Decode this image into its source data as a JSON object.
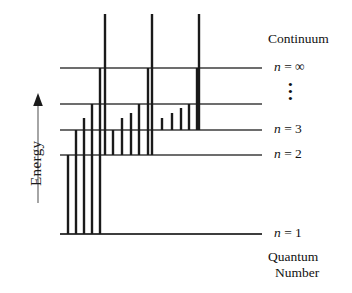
{
  "figure": {
    "title_top": "Continuum",
    "axis": {
      "label": "Energy",
      "direction": "up",
      "arrow_icon": "up-arrow-icon"
    },
    "bottom_caption_line1": "Quantum",
    "bottom_caption_line2": "Number",
    "ellipsis": "•\n•\n•",
    "colors": {
      "level_line": "#3d3d3d",
      "transition_line": "#1a1a1a",
      "text": "#111111",
      "background": "#ffffff"
    }
  },
  "chart_data": {
    "type": "line",
    "xlabel": "Quantum Number",
    "ylabel": "Energy",
    "grid": false,
    "legend": "none",
    "x_extent": [
      60,
      262
    ],
    "y_extent": [
      10,
      236
    ],
    "levels": [
      {
        "id": "n-infinity",
        "label": "n = ∞",
        "n": "∞",
        "y": 68,
        "x_start": 60,
        "x_end": 262,
        "labeled": true
      },
      {
        "id": "n-5",
        "label": "",
        "n": "5",
        "y": 104,
        "x_start": 60,
        "x_end": 262,
        "labeled": false
      },
      {
        "id": "n-3",
        "label": "n = 3",
        "n": "3",
        "y": 130,
        "x_start": 60,
        "x_end": 262,
        "labeled": true
      },
      {
        "id": "n-2",
        "label": "n = 2",
        "n": "2",
        "y": 155,
        "x_start": 60,
        "x_end": 262,
        "labeled": true
      },
      {
        "id": "n-1",
        "label": "n = 1",
        "n": "1",
        "y": 234,
        "x_start": 60,
        "x_end": 262,
        "labeled": true
      }
    ],
    "series": [
      {
        "name": "Lyman series (to n = 1)",
        "target_level": "n-1",
        "transitions": [
          {
            "x": 68,
            "y_top": 155,
            "y_bottom": 234
          },
          {
            "x": 76,
            "y_top": 130,
            "y_bottom": 234
          },
          {
            "x": 84,
            "y_top": 118,
            "y_bottom": 234
          },
          {
            "x": 92,
            "y_top": 104,
            "y_bottom": 234
          },
          {
            "x": 100,
            "y_top": 68,
            "y_bottom": 234
          }
        ]
      },
      {
        "name": "Balmer series (to n = 2)",
        "target_level": "n-2",
        "transitions": [
          {
            "x": 113,
            "y_top": 130,
            "y_bottom": 155
          },
          {
            "x": 122,
            "y_top": 118,
            "y_bottom": 155
          },
          {
            "x": 131,
            "y_top": 113,
            "y_bottom": 155
          },
          {
            "x": 139,
            "y_top": 104,
            "y_bottom": 155
          },
          {
            "x": 148,
            "y_top": 68,
            "y_bottom": 155
          }
        ]
      },
      {
        "name": "Paschen series (to n = 3)",
        "target_level": "n-3",
        "transitions": [
          {
            "x": 162,
            "y_top": 118,
            "y_bottom": 130
          },
          {
            "x": 172,
            "y_top": 113,
            "y_bottom": 130
          },
          {
            "x": 181,
            "y_top": 108,
            "y_bottom": 130
          },
          {
            "x": 189,
            "y_top": 104,
            "y_bottom": 130
          },
          {
            "x": 197,
            "y_top": 68,
            "y_bottom": 130
          }
        ]
      },
      {
        "name": "Ionization to continuum",
        "target_level": "continuum",
        "transitions": [
          {
            "x": 105,
            "y_top": 14,
            "y_bottom": 155
          },
          {
            "x": 152,
            "y_top": 14,
            "y_bottom": 155
          },
          {
            "x": 199,
            "y_top": 14,
            "y_bottom": 130
          }
        ]
      }
    ],
    "annotations": [
      {
        "id": "continuum-label",
        "text": "Continuum",
        "x": 268,
        "y": 40
      },
      {
        "id": "ellipsis",
        "text": "⋮",
        "x": 291,
        "y": 88
      },
      {
        "id": "quantum-number",
        "text": "Quantum Number",
        "x": 268,
        "y": 248
      }
    ]
  }
}
